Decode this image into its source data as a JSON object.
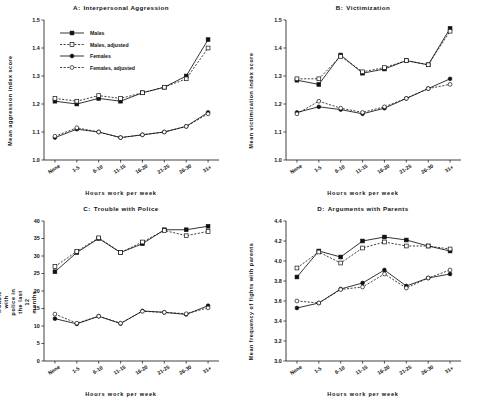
{
  "figure": {
    "categories": [
      "None",
      "1-5",
      "6-10",
      "11-15",
      "16-20",
      "21-25",
      "26-30",
      "31+"
    ],
    "xlabel": "Hours work per week",
    "legend": [
      {
        "label": "Males",
        "style": "solid-filled-square"
      },
      {
        "label": "Males, adjusted",
        "style": "dashed-open-square"
      },
      {
        "label": "Females",
        "style": "solid-filled-circle"
      },
      {
        "label": "Females, adjusted",
        "style": "dashed-open-circle"
      }
    ]
  },
  "chart_data": [
    {
      "type": "line",
      "panel": "A",
      "title_letter": "A:",
      "title": "Interpersonal Aggression",
      "xlabel": "Hours work per week",
      "ylabel": "Mean aggression index score",
      "categories": [
        "None",
        "1-5",
        "6-10",
        "11-15",
        "16-20",
        "21-25",
        "26-30",
        "31+"
      ],
      "ylim": [
        1.0,
        1.5
      ],
      "yticks": [
        "1.0",
        "1.1",
        "1.2",
        "1.3",
        "1.4",
        "1.5"
      ],
      "grid": false,
      "legend_position": "upper-left",
      "series": [
        {
          "name": "Males",
          "values": [
            1.21,
            1.2,
            1.22,
            1.21,
            1.24,
            1.26,
            1.3,
            1.43
          ]
        },
        {
          "name": "Males, adjusted",
          "values": [
            1.22,
            1.21,
            1.23,
            1.22,
            1.24,
            1.26,
            1.29,
            1.4
          ]
        },
        {
          "name": "Females",
          "values": [
            1.08,
            1.11,
            1.1,
            1.08,
            1.09,
            1.1,
            1.12,
            1.17
          ]
        },
        {
          "name": "Females, adjusted",
          "values": [
            1.085,
            1.115,
            1.1,
            1.08,
            1.09,
            1.1,
            1.12,
            1.165
          ]
        }
      ]
    },
    {
      "type": "line",
      "panel": "B",
      "title_letter": "B:",
      "title": "Victimization",
      "xlabel": "Hours work per week",
      "ylabel": "Mean victimization index score",
      "categories": [
        "None",
        "1-5",
        "6-10",
        "11-15",
        "16-20",
        "21-25",
        "26-30",
        "31+"
      ],
      "ylim": [
        1.0,
        1.5
      ],
      "yticks": [
        "1.0",
        "1.1",
        "1.2",
        "1.3",
        "1.4",
        "1.5"
      ],
      "grid": false,
      "legend_position": "none",
      "series": [
        {
          "name": "Males",
          "values": [
            1.285,
            1.27,
            1.375,
            1.31,
            1.325,
            1.355,
            1.34,
            1.47
          ]
        },
        {
          "name": "Males, adjusted",
          "values": [
            1.29,
            1.29,
            1.37,
            1.315,
            1.33,
            1.355,
            1.34,
            1.46
          ]
        },
        {
          "name": "Females",
          "values": [
            1.17,
            1.19,
            1.18,
            1.165,
            1.185,
            1.22,
            1.255,
            1.29
          ]
        },
        {
          "name": "Females, adjusted",
          "values": [
            1.165,
            1.21,
            1.185,
            1.17,
            1.19,
            1.22,
            1.255,
            1.27
          ]
        }
      ]
    },
    {
      "type": "line",
      "panel": "C",
      "title_letter": "C:",
      "title": "Trouble with Police",
      "xlabel": "Hours work per week",
      "ylabel": "Percent reporting trouble with police in the last 12 months",
      "categories": [
        "None",
        "1-5",
        "6-10",
        "11-15",
        "16-20",
        "21-25",
        "26-30",
        "31+"
      ],
      "ylim": [
        0,
        40
      ],
      "yticks": [
        "0",
        "5",
        "10",
        "15",
        "20",
        "25",
        "30",
        "35",
        "40"
      ],
      "grid": false,
      "legend_position": "none",
      "series": [
        {
          "name": "Males",
          "values": [
            25.5,
            31.0,
            35.0,
            31.0,
            33.5,
            37.5,
            37.5,
            38.5
          ]
        },
        {
          "name": "Males, adjusted",
          "values": [
            27.0,
            31.3,
            35.2,
            31.0,
            34.0,
            37.3,
            35.8,
            37.0
          ]
        },
        {
          "name": "Females",
          "values": [
            12.1,
            10.6,
            12.8,
            10.7,
            14.3,
            13.9,
            13.3,
            15.8
          ]
        },
        {
          "name": "Females, adjusted",
          "values": [
            13.4,
            10.8,
            12.8,
            10.8,
            14.2,
            13.9,
            13.5,
            15.2
          ]
        }
      ]
    },
    {
      "type": "line",
      "panel": "D",
      "title_letter": "D:",
      "title": "Arguments with Parents",
      "xlabel": "Hours work per week",
      "ylabel": "Mean frequency of fights with parents",
      "categories": [
        "None",
        "1-5",
        "6-10",
        "11-15",
        "16-20",
        "21-25",
        "26-30",
        "31+"
      ],
      "ylim": [
        3.0,
        4.4
      ],
      "yticks": [
        "3.0",
        "3.2",
        "3.4",
        "3.6",
        "3.8",
        "4.0",
        "4.2",
        "4.4"
      ],
      "grid": false,
      "legend_position": "none",
      "series": [
        {
          "name": "Males",
          "values": [
            3.84,
            4.1,
            4.04,
            4.2,
            4.24,
            4.21,
            4.15,
            4.1
          ]
        },
        {
          "name": "Males, adjusted",
          "values": [
            3.93,
            4.09,
            3.98,
            4.13,
            4.19,
            4.15,
            4.15,
            4.12
          ]
        },
        {
          "name": "Females",
          "values": [
            3.53,
            3.58,
            3.72,
            3.78,
            3.91,
            3.75,
            3.83,
            3.87
          ]
        },
        {
          "name": "Females, adjusted",
          "values": [
            3.6,
            3.58,
            3.715,
            3.74,
            3.87,
            3.73,
            3.83,
            3.91
          ]
        }
      ]
    }
  ]
}
